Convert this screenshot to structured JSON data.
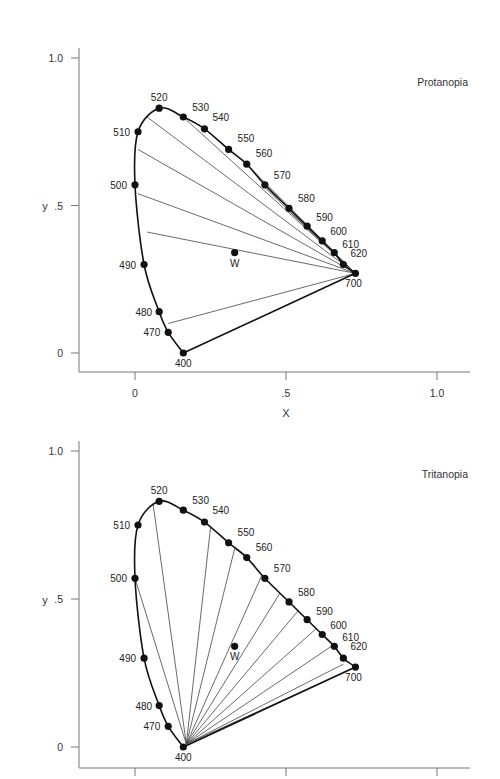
{
  "chart_data": [
    {
      "type": "scatter",
      "title": "Protanopia",
      "xlabel": "X",
      "ylabel": "y",
      "xlim": [
        -0.1,
        1.1
      ],
      "ylim": [
        -0.07,
        1.05
      ],
      "x_ticks": [
        {
          "value": 0,
          "label": "0"
        },
        {
          "value": 0.5,
          "label": ".5"
        },
        {
          "value": 1.0,
          "label": "1.0"
        }
      ],
      "y_ticks": [
        {
          "value": 0,
          "label": "0"
        },
        {
          "value": 0.5,
          "label": ".5"
        },
        {
          "value": 1.0,
          "label": "1.0"
        }
      ],
      "grid": false,
      "spectrum_locus": [
        {
          "nm": "400",
          "x": 0.16,
          "y": 0.0
        },
        {
          "nm": "470",
          "x": 0.11,
          "y": 0.07
        },
        {
          "nm": "480",
          "x": 0.08,
          "y": 0.14
        },
        {
          "nm": "490",
          "x": 0.03,
          "y": 0.3
        },
        {
          "nm": "500",
          "x": 0.0,
          "y": 0.57
        },
        {
          "nm": "510",
          "x": 0.01,
          "y": 0.75
        },
        {
          "nm": "520",
          "x": 0.08,
          "y": 0.83
        },
        {
          "nm": "530",
          "x": 0.16,
          "y": 0.8
        },
        {
          "nm": "540",
          "x": 0.23,
          "y": 0.76
        },
        {
          "nm": "550",
          "x": 0.31,
          "y": 0.69
        },
        {
          "nm": "560",
          "x": 0.37,
          "y": 0.64
        },
        {
          "nm": "570",
          "x": 0.43,
          "y": 0.57
        },
        {
          "nm": "580",
          "x": 0.51,
          "y": 0.49
        },
        {
          "nm": "590",
          "x": 0.57,
          "y": 0.43
        },
        {
          "nm": "600",
          "x": 0.62,
          "y": 0.38
        },
        {
          "nm": "610",
          "x": 0.66,
          "y": 0.34
        },
        {
          "nm": "620",
          "x": 0.69,
          "y": 0.3
        },
        {
          "nm": "700",
          "x": 0.73,
          "y": 0.27
        }
      ],
      "white_point": {
        "label": "W",
        "x": 0.33,
        "y": 0.34
      },
      "confusion_point": {
        "x": 0.73,
        "y": 0.27
      },
      "confusion_line_ends": [
        {
          "x": 0.04,
          "y": 0.41
        },
        {
          "x": 0.01,
          "y": 0.54
        },
        {
          "x": 0.01,
          "y": 0.69
        },
        {
          "x": 0.04,
          "y": 0.8
        },
        {
          "x": 0.17,
          "y": 0.79
        },
        {
          "x": 0.35,
          "y": 0.66
        },
        {
          "x": 0.42,
          "y": 0.57
        },
        {
          "x": 0.5,
          "y": 0.49
        },
        {
          "x": 0.11,
          "y": 0.1
        }
      ]
    },
    {
      "type": "scatter",
      "title": "Tritanopia",
      "xlabel": "",
      "ylabel": "y",
      "xlim": [
        -0.1,
        1.1
      ],
      "ylim": [
        -0.07,
        1.05
      ],
      "x_ticks": [
        {
          "value": 0,
          "label": ""
        },
        {
          "value": 0.5,
          "label": ""
        },
        {
          "value": 1.0,
          "label": ""
        }
      ],
      "y_ticks": [
        {
          "value": 0,
          "label": "0"
        },
        {
          "value": 0.5,
          "label": ".5"
        },
        {
          "value": 1.0,
          "label": "1.0"
        }
      ],
      "grid": false,
      "spectrum_locus": [
        {
          "nm": "400",
          "x": 0.16,
          "y": 0.0
        },
        {
          "nm": "470",
          "x": 0.11,
          "y": 0.07
        },
        {
          "nm": "480",
          "x": 0.08,
          "y": 0.14
        },
        {
          "nm": "490",
          "x": 0.03,
          "y": 0.3
        },
        {
          "nm": "500",
          "x": 0.0,
          "y": 0.57
        },
        {
          "nm": "510",
          "x": 0.01,
          "y": 0.75
        },
        {
          "nm": "520",
          "x": 0.08,
          "y": 0.83
        },
        {
          "nm": "530",
          "x": 0.16,
          "y": 0.8
        },
        {
          "nm": "540",
          "x": 0.23,
          "y": 0.76
        },
        {
          "nm": "550",
          "x": 0.31,
          "y": 0.69
        },
        {
          "nm": "560",
          "x": 0.37,
          "y": 0.64
        },
        {
          "nm": "570",
          "x": 0.43,
          "y": 0.57
        },
        {
          "nm": "580",
          "x": 0.51,
          "y": 0.49
        },
        {
          "nm": "590",
          "x": 0.57,
          "y": 0.43
        },
        {
          "nm": "600",
          "x": 0.62,
          "y": 0.38
        },
        {
          "nm": "610",
          "x": 0.66,
          "y": 0.34
        },
        {
          "nm": "620",
          "x": 0.69,
          "y": 0.3
        },
        {
          "nm": "700",
          "x": 0.73,
          "y": 0.27
        }
      ],
      "white_point": {
        "label": "W",
        "x": 0.33,
        "y": 0.34
      },
      "confusion_point": {
        "x": 0.17,
        "y": 0.01
      },
      "confusion_line_ends": [
        {
          "x": 0.0,
          "y": 0.57
        },
        {
          "x": 0.06,
          "y": 0.82
        },
        {
          "x": 0.25,
          "y": 0.74
        },
        {
          "x": 0.33,
          "y": 0.67
        },
        {
          "x": 0.42,
          "y": 0.58
        },
        {
          "x": 0.48,
          "y": 0.52
        },
        {
          "x": 0.54,
          "y": 0.46
        },
        {
          "x": 0.6,
          "y": 0.4
        },
        {
          "x": 0.65,
          "y": 0.34
        },
        {
          "x": 0.69,
          "y": 0.28
        },
        {
          "x": 0.73,
          "y": 0.27
        }
      ]
    }
  ]
}
